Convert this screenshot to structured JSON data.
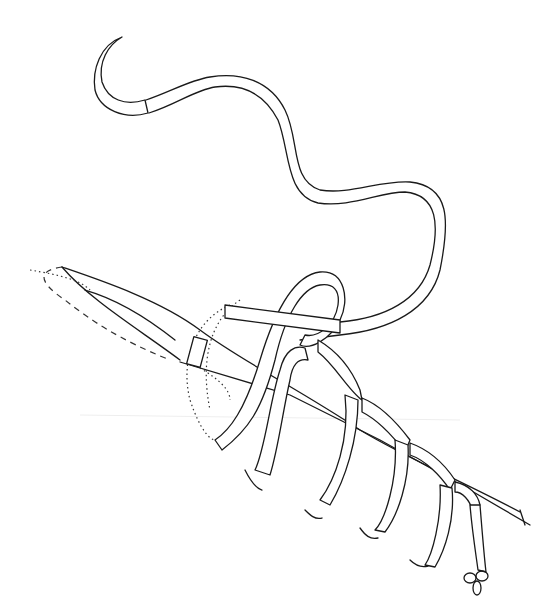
{
  "figure": {
    "type": "line-illustration",
    "colors": {
      "background": "#ffffff",
      "stroke": "#1a1a1a"
    },
    "elements": [
      "needle",
      "suture-thread",
      "tissue-flap",
      "suture-loops",
      "knot"
    ]
  }
}
